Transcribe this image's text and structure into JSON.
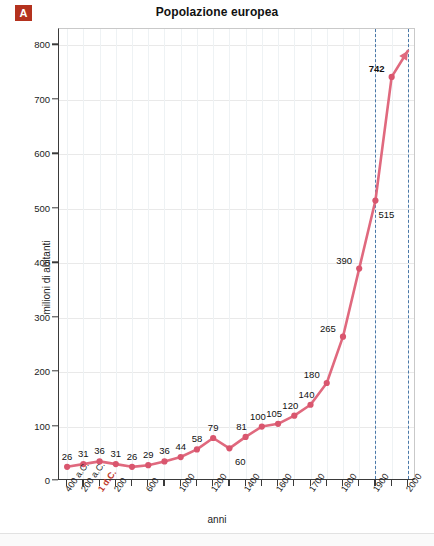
{
  "badge": {
    "letter": "A"
  },
  "chart_data": {
    "type": "line",
    "title": "Popolazione europea",
    "xlabel": "anni",
    "ylabel": "milioni di abitanti",
    "ylim": [
      0,
      830
    ],
    "yticks": [
      0,
      100,
      200,
      300,
      400,
      500,
      600,
      700,
      800
    ],
    "grid": true,
    "legend": "none",
    "categories": [
      "400 a.C.",
      "200 a.C.",
      "1 d.C.",
      "200",
      "400",
      "600",
      "800",
      "1000",
      "1100",
      "1200",
      "1300",
      "1400",
      "1500",
      "1600",
      "1650",
      "1700",
      "1750",
      "1800",
      "1850",
      "1900",
      "1950",
      "2000"
    ],
    "xtick_labels": [
      {
        "index": 0,
        "text": "400 a.C.",
        "highlight": false
      },
      {
        "index": 1,
        "text": "200 a.C.",
        "highlight": false
      },
      {
        "index": 2,
        "text": "1 d.C.",
        "highlight": true
      },
      {
        "index": 3,
        "text": "200",
        "highlight": false
      },
      {
        "index": 5,
        "text": "600",
        "highlight": false
      },
      {
        "index": 7,
        "text": "1000",
        "highlight": false
      },
      {
        "index": 9,
        "text": "1200",
        "highlight": false
      },
      {
        "index": 11,
        "text": "1400",
        "highlight": false
      },
      {
        "index": 13,
        "text": "1600",
        "highlight": false
      },
      {
        "index": 15,
        "text": "1700",
        "highlight": false
      },
      {
        "index": 17,
        "text": "1800",
        "highlight": false
      },
      {
        "index": 19,
        "text": "1900",
        "highlight": false
      },
      {
        "index": 21,
        "text": "2000",
        "highlight": false
      }
    ],
    "values": [
      26,
      31,
      36,
      31,
      26,
      29,
      36,
      44,
      58,
      79,
      60,
      81,
      100,
      105,
      120,
      140,
      180,
      265,
      390,
      515,
      742,
      790
    ],
    "point_labels": [
      {
        "index": 0,
        "value": 26,
        "text": "26",
        "bold": false
      },
      {
        "index": 1,
        "value": 31,
        "text": "31",
        "bold": false
      },
      {
        "index": 2,
        "value": 36,
        "text": "36",
        "bold": false
      },
      {
        "index": 3,
        "value": 31,
        "text": "31",
        "bold": false
      },
      {
        "index": 4,
        "value": 26,
        "text": "26",
        "bold": false
      },
      {
        "index": 5,
        "value": 29,
        "text": "29",
        "bold": false
      },
      {
        "index": 6,
        "value": 36,
        "text": "36",
        "bold": false
      },
      {
        "index": 7,
        "value": 44,
        "text": "44",
        "bold": false
      },
      {
        "index": 8,
        "value": 58,
        "text": "58",
        "bold": false
      },
      {
        "index": 9,
        "value": 79,
        "text": "79",
        "bold": false
      },
      {
        "index": 10,
        "value": 60,
        "text": "60",
        "bold": false
      },
      {
        "index": 11,
        "value": 81,
        "text": "81",
        "bold": false
      },
      {
        "index": 12,
        "value": 100,
        "text": "100",
        "bold": false
      },
      {
        "index": 13,
        "value": 105,
        "text": "105",
        "bold": false
      },
      {
        "index": 14,
        "value": 120,
        "text": "120",
        "bold": false
      },
      {
        "index": 15,
        "value": 140,
        "text": "140",
        "bold": false
      },
      {
        "index": 16,
        "value": 180,
        "text": "180",
        "bold": false
      },
      {
        "index": 17,
        "value": 265,
        "text": "265",
        "bold": false
      },
      {
        "index": 18,
        "value": 390,
        "text": "390",
        "bold": false
      },
      {
        "index": 19,
        "value": 515,
        "text": "515",
        "bold": false
      },
      {
        "index": 20,
        "value": 742,
        "text": "742",
        "bold": true
      }
    ],
    "annotations": {
      "dashed_vlines": [
        {
          "at_index": 19,
          "color": "#4a78a8",
          "style": "dashed"
        },
        {
          "at_index": 21,
          "color": "#4a78a8",
          "style": "dashed"
        }
      ],
      "arrow_end": true
    },
    "colors": {
      "line": "#e0697e",
      "marker": "#d9566e",
      "badge": "#b4321e",
      "highlight_tick": "#c0392b",
      "dashed_vline": "#4a78a8",
      "axis": "#3a3a3a",
      "grid": "#e9e9e9"
    }
  }
}
